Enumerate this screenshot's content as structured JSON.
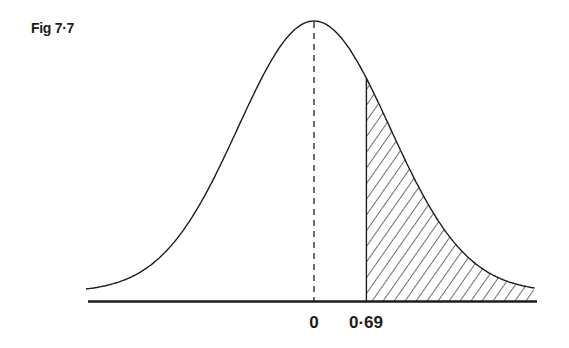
{
  "figure": {
    "title": "Fig 7·7"
  },
  "chart_data": {
    "type": "area",
    "title": "Fig 7·7",
    "xlabel": "",
    "ylabel": "",
    "tick_labels": [
      "0",
      "0·69"
    ],
    "ticks": [
      0,
      0.69
    ],
    "mean": 0,
    "sd": 1,
    "shaded_region": {
      "from": 0.69,
      "to": "infinity",
      "style": "diagonal hatch"
    },
    "reference_line": {
      "x": 0,
      "style": "dashed"
    },
    "xlim": [
      -3.0,
      2.9
    ],
    "grid": false,
    "legend": null
  },
  "colors": {
    "ink": "#1c1c1c",
    "background": "#ffffff"
  }
}
